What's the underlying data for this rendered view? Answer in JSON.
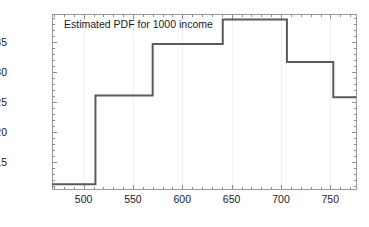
{
  "chart_data": {
    "type": "line",
    "subtype": "step-histogram-pdf",
    "title": "Estimated PDF for 1000 income",
    "xlabel": "",
    "ylabel": "",
    "xlim": [
      468,
      776
    ],
    "ylim": [
      0.00105,
      0.00397
    ],
    "grid": true,
    "legend": null,
    "legend_position": "none",
    "x_ticks": [
      500,
      550,
      600,
      650,
      700,
      750
    ],
    "x_tick_labels": [
      "500",
      "550",
      "600",
      "650",
      "700",
      "750"
    ],
    "x_minor_tick_step": 10,
    "y_ticks": [
      0.0015,
      0.002,
      0.0025,
      0.003,
      0.0035
    ],
    "y_tick_labels": [
      "0.0015",
      "0.0020",
      "0.0025",
      "0.0030",
      "0.0035"
    ],
    "y_minor_tick_step": 0.0001,
    "bin_edges": [
      468,
      512,
      570,
      641,
      706,
      753,
      776
    ],
    "values": [
      0.00113,
      0.00261,
      0.00347,
      0.00388,
      0.00317,
      0.00258
    ],
    "bins": [
      {
        "from": 468,
        "to": 512,
        "density": 0.00113
      },
      {
        "from": 512,
        "to": 570,
        "density": 0.00261
      },
      {
        "from": 570,
        "to": 641,
        "density": 0.00347
      },
      {
        "from": 641,
        "to": 706,
        "density": 0.00388
      },
      {
        "from": 706,
        "to": 753,
        "density": 0.00317
      },
      {
        "from": 753,
        "to": 776,
        "density": 0.00258
      }
    ],
    "colors": {
      "curve": "#5a5a5a",
      "axis": "#9a9a9a",
      "grid": "#f0f0f0",
      "text": "#1a1a1a",
      "background": "#ffffff"
    }
  }
}
